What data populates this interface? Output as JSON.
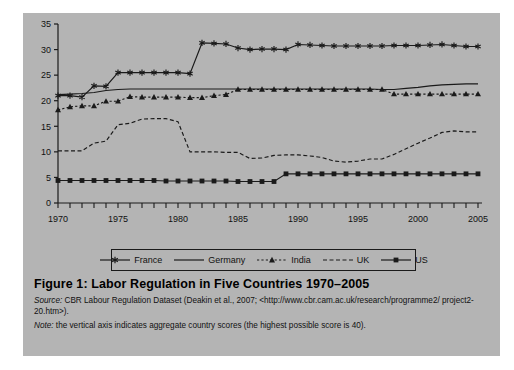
{
  "figure": {
    "title": "Figure 1:  Labor Regulation in Five Countries  1970–2005",
    "source_key": "Source:",
    "source_text": " CBR Labour Regulation Dataset (Deakin et al., 2007; <http://www.cbr.cam.ac.uk/research/programme2/ project2-20.htm>).",
    "note_key": "Note:",
    "note_text": "  the vertical axis indicates aggregate country scores (the highest possible score is 40).",
    "panel_color": "#b4b4b4",
    "ink_color": "#1a1a1a"
  },
  "legend": {
    "position": "bottom-center",
    "entries": [
      {
        "label": "France",
        "marker": "asterisk-icon",
        "line": "solid"
      },
      {
        "label": "Germany",
        "marker": "none",
        "line": "solid"
      },
      {
        "label": "India",
        "marker": "triangle-icon",
        "line": "dotted"
      },
      {
        "label": "UK",
        "marker": "none",
        "line": "dashed"
      },
      {
        "label": "US",
        "marker": "square-icon",
        "line": "solid"
      }
    ]
  },
  "chart_data": {
    "type": "line",
    "title": "Labor Regulation in Five Countries 1970–2005",
    "xlabel": "",
    "ylabel": "",
    "xlim": [
      1970,
      2005
    ],
    "ylim": [
      0,
      35
    ],
    "grid": false,
    "legend_position": "bottom-center",
    "ytick_labels": [
      "0",
      "5",
      "10",
      "15",
      "20",
      "25",
      "30",
      "35"
    ],
    "yticks": [
      0,
      5,
      10,
      15,
      20,
      25,
      30,
      35
    ],
    "xtick_labels": [
      "1970",
      "1975",
      "1980",
      "1985",
      "1990",
      "1995",
      "2000",
      "2005"
    ],
    "xticks": [
      1970,
      1975,
      1980,
      1985,
      1990,
      1995,
      2000,
      2005
    ],
    "minor_xticks_every": 1,
    "x": [
      1970,
      1971,
      1972,
      1973,
      1974,
      1975,
      1976,
      1977,
      1978,
      1979,
      1980,
      1981,
      1982,
      1983,
      1984,
      1985,
      1986,
      1987,
      1988,
      1989,
      1990,
      1991,
      1992,
      1993,
      1994,
      1995,
      1996,
      1997,
      1998,
      1999,
      2000,
      2001,
      2002,
      2003,
      2004,
      2005
    ],
    "series": [
      {
        "name": "France",
        "marker": "asterisk",
        "line": "solid",
        "values": [
          21.0,
          21.0,
          20.7,
          22.9,
          22.8,
          25.5,
          25.5,
          25.5,
          25.5,
          25.5,
          25.5,
          25.3,
          31.3,
          31.2,
          31.1,
          30.3,
          30.0,
          30.1,
          30.1,
          30.0,
          31.0,
          30.9,
          30.8,
          30.7,
          30.7,
          30.7,
          30.7,
          30.7,
          30.8,
          30.8,
          30.8,
          30.9,
          31.0,
          30.8,
          30.6,
          30.6
        ]
      },
      {
        "name": "Germany",
        "marker": "none",
        "line": "solid",
        "values": [
          21.2,
          21.3,
          21.4,
          21.6,
          22.0,
          22.2,
          22.3,
          22.3,
          22.3,
          22.3,
          22.3,
          22.3,
          22.3,
          22.3,
          22.3,
          22.3,
          22.3,
          22.3,
          22.3,
          22.3,
          22.3,
          22.3,
          22.3,
          22.3,
          22.3,
          22.3,
          22.3,
          22.2,
          22.2,
          22.4,
          22.6,
          22.9,
          23.1,
          23.2,
          23.3,
          23.3
        ]
      },
      {
        "name": "India",
        "marker": "triangle",
        "line": "dotted",
        "values": [
          18.2,
          18.8,
          19.0,
          19.0,
          19.9,
          19.9,
          20.8,
          20.7,
          20.7,
          20.7,
          20.7,
          20.6,
          20.6,
          21.0,
          21.2,
          22.2,
          22.2,
          22.2,
          22.2,
          22.2,
          22.2,
          22.2,
          22.2,
          22.2,
          22.2,
          22.2,
          22.2,
          22.2,
          21.3,
          21.3,
          21.3,
          21.3,
          21.3,
          21.3,
          21.3,
          21.3
        ]
      },
      {
        "name": "UK",
        "marker": "none",
        "line": "dashed",
        "values": [
          10.2,
          10.2,
          10.2,
          11.7,
          12.1,
          15.3,
          15.6,
          16.4,
          16.5,
          16.5,
          15.9,
          10.0,
          10.0,
          10.0,
          9.9,
          9.9,
          8.7,
          8.8,
          9.3,
          9.4,
          9.4,
          9.2,
          8.9,
          8.2,
          8.0,
          8.2,
          8.6,
          8.6,
          9.5,
          10.6,
          11.7,
          12.7,
          13.8,
          14.1,
          13.9,
          13.9
        ]
      },
      {
        "name": "US",
        "marker": "square",
        "line": "solid",
        "values": [
          4.4,
          4.4,
          4.4,
          4.4,
          4.4,
          4.4,
          4.4,
          4.4,
          4.4,
          4.3,
          4.3,
          4.3,
          4.3,
          4.3,
          4.3,
          4.2,
          4.2,
          4.2,
          4.2,
          5.7,
          5.7,
          5.7,
          5.7,
          5.7,
          5.7,
          5.7,
          5.7,
          5.7,
          5.7,
          5.7,
          5.7,
          5.7,
          5.7,
          5.7,
          5.7,
          5.7
        ]
      }
    ]
  }
}
